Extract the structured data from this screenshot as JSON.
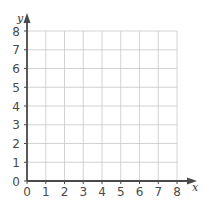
{
  "chart_data": {
    "type": "scatter",
    "title": "",
    "xlabel": "x",
    "ylabel": "y",
    "xlim": [
      0,
      8
    ],
    "ylim": [
      0,
      8
    ],
    "x_ticks": [
      "0",
      "1",
      "2",
      "3",
      "4",
      "5",
      "6",
      "7",
      "8"
    ],
    "y_ticks": [
      "0",
      "1",
      "2",
      "3",
      "4",
      "5",
      "6",
      "7",
      "8"
    ],
    "grid": true,
    "series": [],
    "legend": null
  },
  "colors": {
    "grid": "#c8c8c8",
    "axis": "#4a4a4a",
    "text": "#4a4a4a"
  }
}
